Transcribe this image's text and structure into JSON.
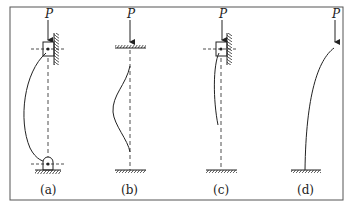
{
  "figure": {
    "type": "column buckling modes under axial load",
    "load_symbol": "P",
    "panels": [
      {
        "id": "a",
        "label": "(a)",
        "load_label": "P",
        "top_support": "sliding clamp (guided, wall)",
        "bottom_support": "pin (hinge)",
        "shape": "large single bow"
      },
      {
        "id": "b",
        "label": "(b)",
        "load_label": "P",
        "top_support": "fixed (clamped, horizontal)",
        "bottom_support": "fixed (clamped)",
        "shape": "S-curve, bulge near mid"
      },
      {
        "id": "c",
        "label": "(c)",
        "load_label": "P",
        "top_support": "sliding clamp (guided, wall)",
        "bottom_support": "fixed (clamped)",
        "shape": "slight curve in upper half"
      },
      {
        "id": "d",
        "label": "(d)",
        "load_label": "P",
        "top_support": "free",
        "bottom_support": "fixed (clamped)",
        "shape": "cantilever bend"
      }
    ]
  },
  "colors": {
    "line": "#222222",
    "frame": "#555555",
    "background": "#ffffff"
  }
}
